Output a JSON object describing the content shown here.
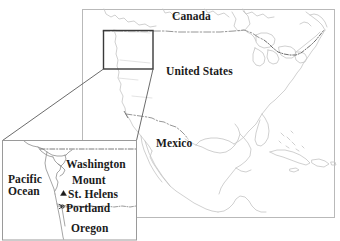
{
  "image": {
    "title": "Locator map of Mount St. Helens",
    "width": 340,
    "height": 241,
    "background_color": "#ffffff"
  },
  "colors": {
    "coastline": "#c4c4c4",
    "border_line": "#8a8a8a",
    "frame": "#b9b9b9",
    "detail_box": "#3a3a3a",
    "connector": "#5a5a5a",
    "label_text": "#1b1b1b",
    "inset_frame": "#9a9a9a"
  },
  "main_map": {
    "name": "north-america-overview",
    "frame": {
      "x": 82,
      "y": 9,
      "width": 253,
      "height": 209
    },
    "labels": [
      {
        "id": "canada",
        "text": "Canada",
        "x": 172,
        "y": 10
      },
      {
        "id": "united-states",
        "text": "United States",
        "x": 166,
        "y": 65
      },
      {
        "id": "mexico",
        "text": "Mexico",
        "x": 156,
        "y": 137
      }
    ],
    "detail_box": {
      "x": 103,
      "y": 30,
      "width": 50,
      "height": 39
    },
    "border_style": "dash-dot"
  },
  "inset_map": {
    "name": "pacific-northwest-detail",
    "frame": {
      "x": 2,
      "y": 140,
      "width": 135,
      "height": 100
    },
    "labels": [
      {
        "id": "pacific-ocean-line1",
        "text": "Pacific"
      },
      {
        "id": "pacific-ocean-line2",
        "text": "Ocean"
      },
      {
        "id": "washington",
        "text": "Washington"
      },
      {
        "id": "mount",
        "text": "Mount"
      },
      {
        "id": "st-helens",
        "text": "St. Helens"
      },
      {
        "id": "portland",
        "text": "Portland"
      },
      {
        "id": "oregon",
        "text": "Oregon"
      }
    ],
    "markers": [
      {
        "id": "mount-st-helens-marker",
        "symbol": "triangle",
        "x": 63.5,
        "y": 195
      },
      {
        "id": "portland-marker",
        "symbol": "city-dot",
        "x": 62.5,
        "y": 208
      }
    ]
  }
}
